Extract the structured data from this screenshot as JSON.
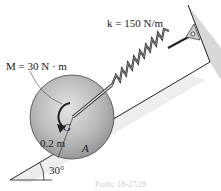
{
  "diagram": {
    "moment_label": "M = 30 N · m",
    "spring_label": "k = 150 N/m",
    "center_label": "G",
    "radius_label": "0.2 m",
    "contact_label": "A",
    "angle_label": "30°",
    "caption": "Probs. 18-27/28"
  },
  "colors": {
    "disk": "#a9a9a9",
    "disk_light": "#d8d8d8",
    "incline_shadow": "#c8c8c8",
    "spring": "#444444",
    "line": "#222222"
  }
}
